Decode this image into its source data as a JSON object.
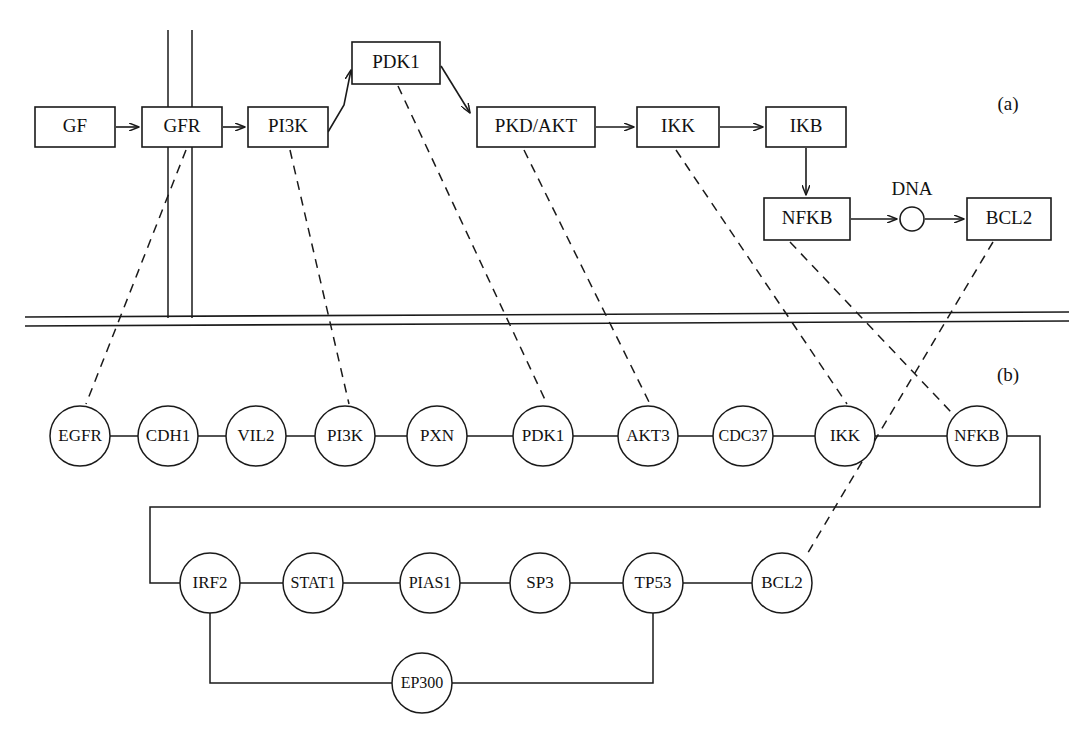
{
  "figure": {
    "type": "pathway-diagram",
    "background_color": "#ffffff",
    "line_color": "#1a1a1a",
    "panels": [
      {
        "id": "a",
        "label": "(a)",
        "x": 1008,
        "y": 106
      },
      {
        "id": "b",
        "label": "(b)",
        "x": 1008,
        "y": 377
      }
    ]
  },
  "panel_a": {
    "description": "Signal transduction pathway of boxed proteins above the cell membrane",
    "boxes": [
      {
        "id": "GF",
        "label": "GF",
        "x": 35,
        "y": 107,
        "w": 80,
        "h": 40
      },
      {
        "id": "GFR",
        "label": "GFR",
        "x": 142,
        "y": 107,
        "w": 80,
        "h": 40
      },
      {
        "id": "PI3K",
        "label": "PI3K",
        "x": 248,
        "y": 107,
        "w": 80,
        "h": 40
      },
      {
        "id": "PDK1",
        "label": "PDK1",
        "x": 352,
        "y": 42,
        "w": 88,
        "h": 42
      },
      {
        "id": "PKD/AKT",
        "label": "PKD/AKT",
        "x": 477,
        "y": 107,
        "w": 118,
        "h": 40
      },
      {
        "id": "IKK",
        "label": "IKK",
        "x": 637,
        "y": 107,
        "w": 82,
        "h": 40
      },
      {
        "id": "IKB",
        "label": "IKB",
        "x": 766,
        "y": 107,
        "w": 80,
        "h": 40
      },
      {
        "id": "NFKB",
        "label": "NFKB",
        "x": 764,
        "y": 198,
        "w": 86,
        "h": 42
      },
      {
        "id": "BCL2",
        "label": "BCL2",
        "x": 967,
        "y": 198,
        "w": 84,
        "h": 42
      }
    ],
    "dna": {
      "label": "DNA",
      "cx": 912,
      "cy": 219,
      "r": 12,
      "label_x": 912,
      "label_y": 191
    },
    "arrows": [
      {
        "from": "GF",
        "to": "GFR"
      },
      {
        "from": "GFR",
        "to": "PI3K"
      },
      {
        "from": "PI3K",
        "to": "PDK1"
      },
      {
        "from": "PDK1",
        "to": "PKD/AKT"
      },
      {
        "from": "PKD/AKT",
        "to": "IKK"
      },
      {
        "from": "IKK",
        "to": "IKB"
      },
      {
        "from": "IKB",
        "to": "NFKB"
      },
      {
        "from": "NFKB",
        "to": "DNA"
      },
      {
        "from": "DNA",
        "to": "BCL2"
      }
    ],
    "membrane": {
      "y_top": 317,
      "y_bottom": 326,
      "x_start": 25,
      "x_end": 1069
    },
    "receptor_stems": [
      {
        "x": 168,
        "y_top": 30,
        "y_bottom": 318
      },
      {
        "x": 192,
        "y_top": 30,
        "y_bottom": 318
      }
    ]
  },
  "panel_b": {
    "description": "Protein interaction network of circular nodes below the cell membrane",
    "row_top": [
      {
        "id": "EGFR",
        "label": "EGFR",
        "cx": 80,
        "cy": 436,
        "r": 30
      },
      {
        "id": "CDH1",
        "label": "CDH1",
        "cx": 168,
        "cy": 436,
        "r": 30
      },
      {
        "id": "VIL2",
        "label": "VIL2",
        "cx": 256,
        "cy": 436,
        "r": 30
      },
      {
        "id": "PI3K",
        "label": "PI3K",
        "cx": 345,
        "cy": 436,
        "r": 30
      },
      {
        "id": "PXN",
        "label": "PXN",
        "cx": 437,
        "cy": 436,
        "r": 30
      },
      {
        "id": "PDK1",
        "label": "PDK1",
        "cx": 543,
        "cy": 436,
        "r": 30
      },
      {
        "id": "AKT3",
        "label": "AKT3",
        "cx": 648,
        "cy": 436,
        "r": 30
      },
      {
        "id": "CDC37",
        "label": "CDC37",
        "cx": 743,
        "cy": 436,
        "r": 30
      },
      {
        "id": "IKK",
        "label": "IKK",
        "cx": 845,
        "cy": 436,
        "r": 30
      },
      {
        "id": "NFKB",
        "label": "NFKB",
        "cx": 977,
        "cy": 436,
        "r": 30
      }
    ],
    "row_bottom": [
      {
        "id": "IRF2",
        "label": "IRF2",
        "cx": 210,
        "cy": 583,
        "r": 30
      },
      {
        "id": "STAT1",
        "label": "STAT1",
        "cx": 313,
        "cy": 583,
        "r": 30
      },
      {
        "id": "PIAS1",
        "label": "PIAS1",
        "cx": 430,
        "cy": 583,
        "r": 30
      },
      {
        "id": "SP3",
        "label": "SP3",
        "cx": 540,
        "cy": 583,
        "r": 30
      },
      {
        "id": "TP53",
        "label": "TP53",
        "cx": 653,
        "cy": 583,
        "r": 30
      },
      {
        "id": "BCL2",
        "label": "BCL2",
        "cx": 782,
        "cy": 583,
        "r": 30
      }
    ],
    "row_extra": [
      {
        "id": "EP300",
        "label": "EP300",
        "cx": 422,
        "cy": 683,
        "r": 30
      }
    ],
    "edges": [
      {
        "from": "EGFR",
        "to": "CDH1"
      },
      {
        "from": "CDH1",
        "to": "VIL2"
      },
      {
        "from": "VIL2",
        "to": "PI3K"
      },
      {
        "from": "PI3K",
        "to": "PXN"
      },
      {
        "from": "PXN",
        "to": "PDK1"
      },
      {
        "from": "PDK1",
        "to": "AKT3"
      },
      {
        "from": "AKT3",
        "to": "CDC37"
      },
      {
        "from": "CDC37",
        "to": "IKK"
      },
      {
        "from": "IKK",
        "to": "NFKB"
      },
      {
        "from": "NFKB",
        "to": "IRF2"
      },
      {
        "from": "IRF2",
        "to": "STAT1"
      },
      {
        "from": "STAT1",
        "to": "PIAS1"
      },
      {
        "from": "PIAS1",
        "to": "SP3"
      },
      {
        "from": "SP3",
        "to": "TP53"
      },
      {
        "from": "TP53",
        "to": "BCL2"
      },
      {
        "from": "IRF2",
        "to": "EP300"
      },
      {
        "from": "EP300",
        "to": "TP53"
      }
    ]
  },
  "correspondence_links": [
    {
      "from_panel_a": "GFR",
      "to_panel_b": "EGFR"
    },
    {
      "from_panel_a": "PI3K",
      "to_panel_b": "PI3K"
    },
    {
      "from_panel_a": "PDK1",
      "to_panel_b": "PDK1"
    },
    {
      "from_panel_a": "PKD/AKT",
      "to_panel_b": "AKT3"
    },
    {
      "from_panel_a": "IKK",
      "to_panel_b": "IKK"
    },
    {
      "from_panel_a": "NFKB",
      "to_panel_b": "NFKB"
    },
    {
      "from_panel_a": "BCL2",
      "to_panel_b": "BCL2"
    }
  ]
}
